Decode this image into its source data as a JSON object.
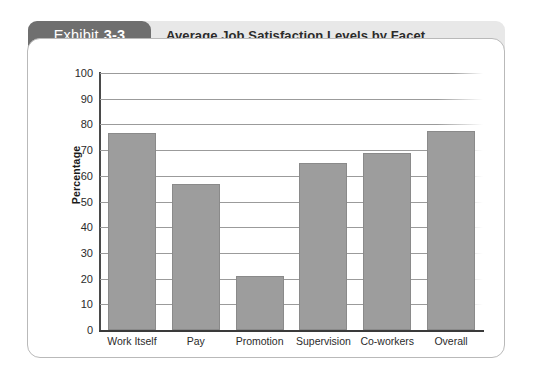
{
  "header": {
    "badge_word": "Exhibit",
    "badge_number": "3-3",
    "title": "Average Job Satisfaction Levels by Facet"
  },
  "chart_data": {
    "type": "bar",
    "title": "Average Job Satisfaction Levels by Facet",
    "xlabel": "",
    "ylabel": "Percentage",
    "ylim": [
      0,
      100
    ],
    "ytick_step": 10,
    "yticks": [
      "100",
      "90",
      "80",
      "70",
      "60",
      "50",
      "40",
      "30",
      "20",
      "10",
      "0"
    ],
    "grid": true,
    "legend": "none",
    "categories": [
      "Work Itself",
      "Pay",
      "Promotion",
      "Supervision",
      "Co-workers",
      "Overall"
    ],
    "values": [
      76.5,
      57,
      21,
      65,
      69,
      77.5
    ],
    "bar_color": "#9d9d9d"
  },
  "colors": {
    "badge_background": "#6f6f6f",
    "banner_background": "#e8e8e8",
    "card_border": "#b9b9b9",
    "bar_fill": "#9d9d9d",
    "axis": "#3a3a3a",
    "gridline": "#9b9b9b",
    "text": "#2b2b2b"
  }
}
